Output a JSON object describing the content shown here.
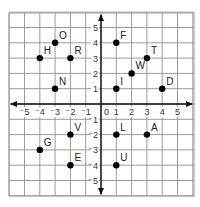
{
  "grid": {
    "x_range": [
      -6,
      6
    ],
    "y_range": [
      -6,
      6
    ],
    "origin_label": "0",
    "x_ticks": [
      "-5",
      "-4",
      "-3",
      "-2",
      "-1",
      "1",
      "2",
      "3",
      "4",
      "5"
    ],
    "y_ticks": [
      "5",
      "4",
      "3",
      "2",
      "1",
      "-1",
      "-2",
      "-3",
      "-4",
      "-5"
    ]
  },
  "points": [
    {
      "label": "O",
      "x": -3,
      "y": 4
    },
    {
      "label": "H",
      "x": -4,
      "y": 3
    },
    {
      "label": "R",
      "x": -2,
      "y": 3
    },
    {
      "label": "N",
      "x": -3,
      "y": 1
    },
    {
      "label": "F",
      "x": 1,
      "y": 4
    },
    {
      "label": "T",
      "x": 3,
      "y": 3
    },
    {
      "label": "W",
      "x": 2,
      "y": 2
    },
    {
      "label": "I",
      "x": 1,
      "y": 1
    },
    {
      "label": "D",
      "x": 4,
      "y": 1
    },
    {
      "label": "V",
      "x": -2,
      "y": -2
    },
    {
      "label": "G",
      "x": -4,
      "y": -3
    },
    {
      "label": "E",
      "x": -2,
      "y": -4
    },
    {
      "label": "L",
      "x": 1,
      "y": -2
    },
    {
      "label": "A",
      "x": 3,
      "y": -2
    },
    {
      "label": "U",
      "x": 1,
      "y": -4
    }
  ]
}
